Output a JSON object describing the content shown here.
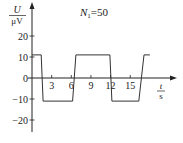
{
  "chart_data": {
    "type": "line",
    "title_parts": {
      "var": "N",
      "sub": "1",
      "rest": "=50"
    },
    "xlabel": "t/s",
    "xlabel_parts": {
      "num": "t",
      "den": "s"
    },
    "ylabel": "U/μV",
    "ylabel_parts": {
      "num": "U",
      "den": "μV"
    },
    "xticks": [
      3,
      6,
      9,
      12,
      15
    ],
    "yticks": [
      20,
      10,
      0,
      -10,
      -20
    ],
    "xlim": [
      0,
      21
    ],
    "ylim": [
      -23,
      35
    ],
    "grid": false,
    "legend": null,
    "series": [
      {
        "name": "U(t)",
        "color": "#333333",
        "x": [
          0,
          1.4,
          1.7,
          6.2,
          6.7,
          11.9,
          12.2,
          16.3,
          17.1,
          18.0
        ],
        "y": [
          11,
          11,
          -11,
          -11,
          11,
          11,
          -11,
          -11,
          11,
          11
        ]
      }
    ]
  }
}
